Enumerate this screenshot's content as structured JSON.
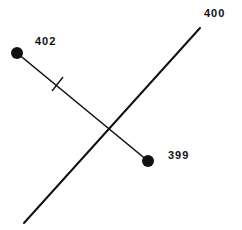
{
  "diagram": {
    "type": "point-to-line perpendicular construction",
    "stroke_color": "#111111",
    "background": "#ffffff",
    "line": {
      "label": "400",
      "x1": 24,
      "y1": 223,
      "x2": 200,
      "y2": 28,
      "label_x": 204,
      "label_y": 17
    },
    "segment": {
      "x1": 17,
      "y1": 53,
      "x2": 148,
      "y2": 161,
      "tick": {
        "x1": 52,
        "y1": 91,
        "x2": 63,
        "y2": 77
      }
    },
    "points": [
      {
        "label": "402",
        "cx": 17,
        "cy": 53,
        "r": 6,
        "label_x": 35,
        "label_y": 45
      },
      {
        "label": "399",
        "cx": 148,
        "cy": 161,
        "r": 6,
        "label_x": 168,
        "label_y": 159
      }
    ]
  }
}
